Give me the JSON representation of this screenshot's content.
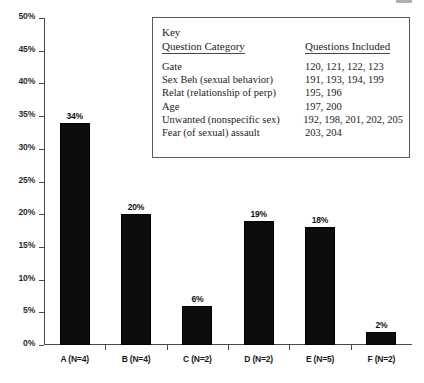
{
  "chart_data": {
    "type": "bar",
    "title": "",
    "xlabel": "",
    "ylabel": "",
    "categories": [
      "A (N=4)",
      "B (N=4)",
      "C (N=2)",
      "D (N=2)",
      "E (N=5)",
      "F (N=2)"
    ],
    "values": [
      34,
      20,
      6,
      19,
      18,
      2
    ],
    "value_labels": [
      "34%",
      "20%",
      "6%",
      "19%",
      "18%",
      "2%"
    ],
    "ylim": [
      0,
      50
    ],
    "ytick_labels": [
      "0%",
      "5%",
      "10%",
      "15%",
      "20%",
      "25%",
      "30%",
      "35%",
      "40%",
      "45%",
      "50%"
    ],
    "ytick_values": [
      0,
      5,
      10,
      15,
      20,
      25,
      30,
      35,
      40,
      45,
      50
    ],
    "grid": false,
    "legend_position": "inside-top-right",
    "bar_color": "#0d0d0d"
  },
  "key": {
    "title": "Key",
    "header_category": "Question Category",
    "header_questions": "Questions Included",
    "rows": [
      {
        "category": "Gate",
        "questions": "120, 121, 122, 123"
      },
      {
        "category": "Sex Beh (sexual behavior)",
        "questions": "191, 193, 194, 199"
      },
      {
        "category": "Relat (relationship of perp)",
        "questions": "195, 196"
      },
      {
        "category": "Age",
        "questions": "197, 200"
      },
      {
        "category": "Unwanted (nonspecific sex)",
        "questions": "192, 198, 201, 202, 205"
      },
      {
        "category": "Fear (of sexual) assault",
        "questions": "203, 204"
      }
    ]
  }
}
